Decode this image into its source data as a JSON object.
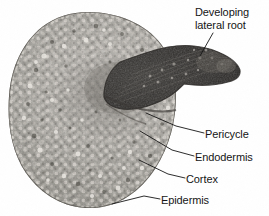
{
  "figure": {
    "image_type": "light micrograph",
    "background_color": "#ffffff",
    "ink_color": "#151515"
  },
  "specimen": {
    "outline_label": "root cross section",
    "lateral_root_label": "developing lateral root wedge",
    "tone": {
      "cell_light": "#e8e6e2",
      "cell_mid": "#9b9892",
      "cell_dark": "#55524d",
      "lateral_root_dark": "#2b2927"
    }
  },
  "labels": [
    {
      "id": "developing-lateral-root",
      "text": "Developing\nlateral root",
      "line1": "Developing",
      "line2": "lateral root",
      "position": "top-right"
    },
    {
      "id": "pericycle",
      "text": "Pericycle",
      "position": "right"
    },
    {
      "id": "endodermis",
      "text": "Endodermis",
      "position": "right"
    },
    {
      "id": "cortex",
      "text": "Cortex",
      "position": "lower-right"
    },
    {
      "id": "epidermis",
      "text": "Epidermis",
      "position": "bottom-right"
    }
  ]
}
